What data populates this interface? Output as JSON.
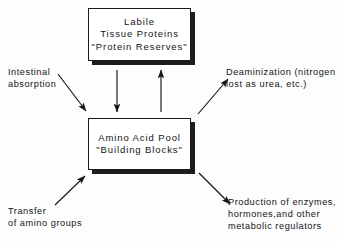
{
  "diagram": {
    "background_color": "#fdfdfd",
    "ink_color": "#141414",
    "nodes": [
      {
        "id": "labile-proteins",
        "lines": [
          "Labile",
          "Tissue Proteins",
          "\"Protein  Reserves\""
        ]
      },
      {
        "id": "amino-acid-pool",
        "lines": [
          "Amino Acid Pool",
          "\"Building Blocks\""
        ]
      }
    ],
    "labels": {
      "intestinal_absorption": {
        "line1": "Intestinal",
        "line2": "absorption"
      },
      "transfer_amino_groups": {
        "line1": "Transfer",
        "line2": "of amino groups"
      },
      "deaminization": {
        "line1": "Deaminization (nitrogen",
        "line2": "lost as urea, etc.)"
      },
      "production_enzymes": {
        "line1": "Production of enzymes,",
        "line2": "hormones,and other",
        "line3": "metabolic regulators"
      }
    },
    "arrows": [
      {
        "id": "pool-to-proteins-down",
        "direction": "down",
        "from": "labile-proteins",
        "to": "amino-acid-pool"
      },
      {
        "id": "pool-to-proteins-up",
        "direction": "up",
        "from": "amino-acid-pool",
        "to": "labile-proteins"
      },
      {
        "id": "intestinal-absorption-in",
        "direction": "down-right",
        "from": "intestinal_absorption",
        "to": "amino-acid-pool"
      },
      {
        "id": "transfer-amino-groups-in",
        "direction": "up-right",
        "from": "transfer_amino_groups",
        "to": "amino-acid-pool"
      },
      {
        "id": "deaminization-out",
        "direction": "up-right",
        "from": "amino-acid-pool",
        "to": "deaminization"
      },
      {
        "id": "production-enzymes-out",
        "direction": "down-right",
        "from": "amino-acid-pool",
        "to": "production_enzymes"
      }
    ]
  }
}
